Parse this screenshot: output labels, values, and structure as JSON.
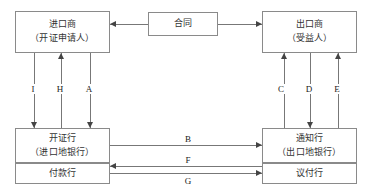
{
  "diagram": {
    "colors": {
      "box_border": "#8a8a8a",
      "line": "#777777",
      "arrow": "#444444",
      "text": "#333333",
      "background": "#ffffff"
    },
    "nodes": [
      {
        "id": "importer",
        "line1": "进口商",
        "line2": "（开证申请人）"
      },
      {
        "id": "contract",
        "line1": "合同",
        "line2": ""
      },
      {
        "id": "exporter",
        "line1": "出口商",
        "line2": "（受益人）"
      },
      {
        "id": "issuing",
        "line1": "开证行",
        "line2": "（进口地银行）"
      },
      {
        "id": "paying",
        "line1": "付款行",
        "line2": ""
      },
      {
        "id": "advising",
        "line1": "通知行",
        "line2": "（出口地银行）"
      },
      {
        "id": "negotiating",
        "line1": "议付行",
        "line2": ""
      }
    ],
    "edges": [
      {
        "id": "contract-to-importer",
        "label": "",
        "from": "contract",
        "to": "importer",
        "direction": "left"
      },
      {
        "id": "contract-to-exporter",
        "label": "",
        "from": "contract",
        "to": "exporter",
        "direction": "right"
      },
      {
        "id": "edge-I",
        "label": "I",
        "from": "importer",
        "to": "issuing",
        "direction": "down"
      },
      {
        "id": "edge-H",
        "label": "H",
        "from": "issuing",
        "to": "importer",
        "direction": "up"
      },
      {
        "id": "edge-A",
        "label": "A",
        "from": "importer",
        "to": "issuing",
        "direction": "down"
      },
      {
        "id": "edge-C",
        "label": "C",
        "from": "advising",
        "to": "exporter",
        "direction": "up"
      },
      {
        "id": "edge-D",
        "label": "D",
        "from": "exporter",
        "to": "advising",
        "direction": "down"
      },
      {
        "id": "edge-E",
        "label": "E",
        "from": "advising",
        "to": "exporter",
        "direction": "up"
      },
      {
        "id": "edge-B",
        "label": "B",
        "from": "issuing",
        "to": "advising",
        "direction": "right"
      },
      {
        "id": "edge-F",
        "label": "F",
        "from": "advising",
        "to": "paying",
        "direction": "left"
      },
      {
        "id": "edge-G",
        "label": "G",
        "from": "paying",
        "to": "negotiating",
        "direction": "right"
      }
    ]
  }
}
